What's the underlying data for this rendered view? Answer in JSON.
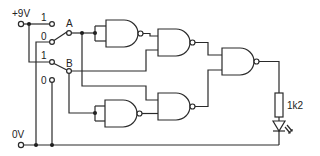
{
  "diagram": {
    "type": "logic circuit schematic",
    "supply": {
      "positive_label": "+9V",
      "ground_label": "0V"
    },
    "switches": [
      {
        "id": "A",
        "label": "A",
        "pos_high": "1",
        "pos_low": "0"
      },
      {
        "id": "B",
        "label": "B",
        "pos_high": "1",
        "pos_low": "0"
      }
    ],
    "gates": [
      {
        "id": "nand1",
        "type": "NAND",
        "inputs": [
          "A",
          "A"
        ],
        "role": "inverter"
      },
      {
        "id": "nand2",
        "type": "NAND",
        "inputs": [
          "nand1",
          "B"
        ]
      },
      {
        "id": "nand3",
        "type": "NAND",
        "inputs": [
          "nand2",
          "nand5"
        ],
        "role": "output"
      },
      {
        "id": "nand4",
        "type": "NAND",
        "inputs": [
          "B",
          "B"
        ],
        "role": "inverter"
      },
      {
        "id": "nand5",
        "type": "NAND",
        "inputs": [
          "A",
          "nand4"
        ]
      }
    ],
    "resistor": {
      "label": "1k2"
    },
    "led": {
      "label": "LED"
    },
    "colors": {
      "line": "#2a2a2a",
      "background": "#ffffff"
    }
  }
}
